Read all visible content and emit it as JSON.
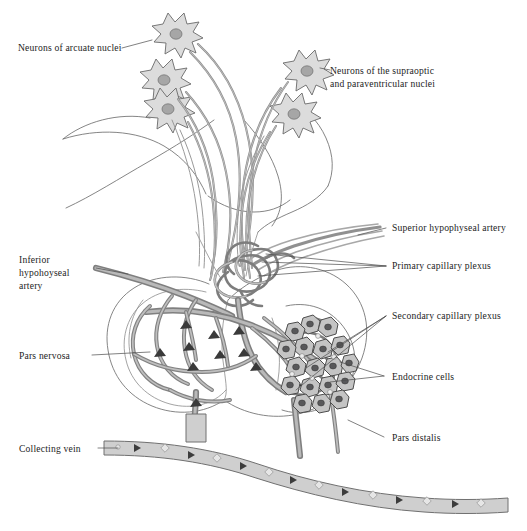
{
  "figure": {
    "width": 527,
    "height": 531,
    "background_color": "#ffffff"
  },
  "palette": {
    "text": "#1d1d1d",
    "outline": "#6f6f6f",
    "vessel": "#7f7f7f",
    "vessel_lumen": "#b9b9b9",
    "neuron_fill": "#dcdcdc",
    "neuron_nucleus": "#a6a6a6",
    "endocrine_cell": "#c4c4c4",
    "endocrine_nucleus": "#58585a",
    "vein_fill": "#cfcfcf",
    "leader_line": "#4a4a4a"
  },
  "labels": {
    "neurons_arcuate": "Neurons of arcuate nuclei",
    "neurons_supraoptic_line1": "Neurons of the supraoptic",
    "neurons_supraoptic_line2": "and paraventricular nuclei",
    "superior_hypophyseal_artery": "Superior hypophyseal artery",
    "primary_capillary_plexus": "Primary capillary plexus",
    "secondary_capillary_plexus": "Secondary capillary plexus",
    "endocrine_cells": "Endocrine cells",
    "pars_distalis": "Pars distalis",
    "inferior_artery_line1": "Inferior",
    "inferior_artery_line2": "hypohoyseal",
    "inferior_artery_line3": "artery",
    "pars_nervosa": "Pars nervosa",
    "collecting_vein": "Collecting vein"
  },
  "structures": {
    "arcuate_neuron_count": 3,
    "supraoptic_neuron_count": 2,
    "region_names": [
      "hypothalamus",
      "infundibular-stalk",
      "pars-nervosa",
      "pars-distalis",
      "primary-capillary-plexus",
      "secondary-capillary-plexus",
      "collecting-vein",
      "superior-hypophyseal-artery",
      "inferior-hypophyseal-artery"
    ]
  }
}
